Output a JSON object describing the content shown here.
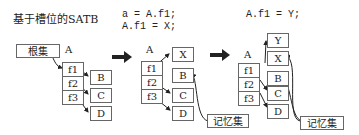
{
  "title": "基于槽位的SATB",
  "code": {
    "step1_line1": "a = A.f1;",
    "step1_line2": "A.f1 = X;",
    "step2_line1": "A.f1 = Y;"
  },
  "labels": {
    "root_set": "根集",
    "remembered_set": "记忆集",
    "object_a": "A",
    "field_f1": "f1",
    "field_f2": "f2",
    "field_f3": "f3",
    "obj_b": "B",
    "obj_c": "C",
    "obj_d": "D",
    "obj_x": "X",
    "obj_y": "Y"
  },
  "arrows": {
    "transition": "⇒"
  }
}
